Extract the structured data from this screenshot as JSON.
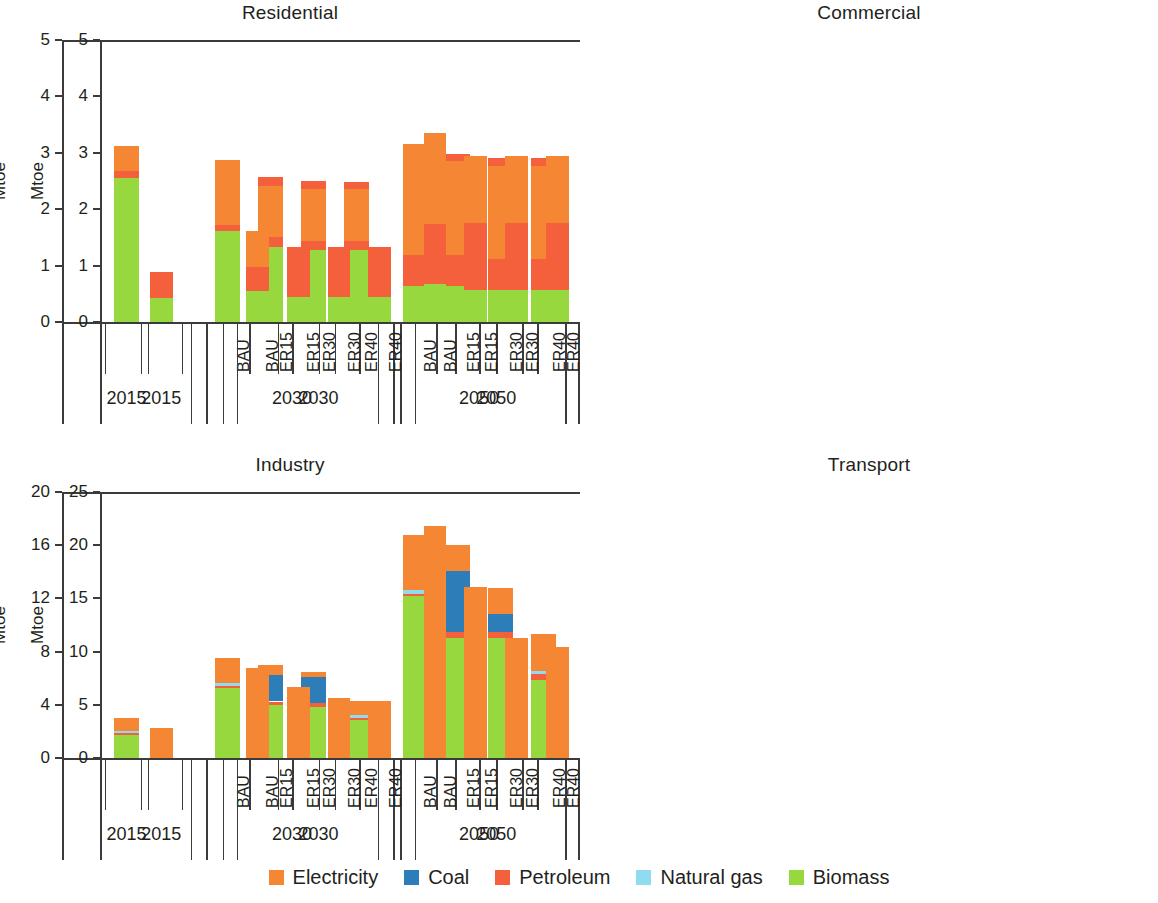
{
  "figure": {
    "ylabel": "Mtoe",
    "year_groups": [
      "2015",
      "2030",
      "2050"
    ],
    "scenarios_2015": [
      "",
      "",
      ""
    ],
    "scenarios": [
      "BAU",
      "ER15",
      "ER30",
      "ER40"
    ]
  },
  "legend": {
    "position": "bottom-center",
    "items": [
      {
        "label": "Electricity",
        "color": "#f58634"
      },
      {
        "label": "Coal",
        "color": "#2d7eb8"
      },
      {
        "label": "Petroleum",
        "color": "#f4603c"
      },
      {
        "label": "Natural gas",
        "color": "#8fdcf0"
      },
      {
        "label": "Biomass",
        "color": "#97d83f"
      }
    ]
  },
  "chart_data": [
    {
      "type": "bar",
      "stacked": true,
      "title": "Residential",
      "xlabel": "",
      "ylabel": "Mtoe",
      "ylim": [
        0,
        5
      ],
      "yticks": [
        0,
        1,
        2,
        3,
        4,
        5
      ],
      "grid": false,
      "groups": [
        "2015",
        "2030",
        "2050"
      ],
      "categories": [
        "2015",
        "2030 BAU",
        "2030 ER15",
        "2030 ER30",
        "2030 ER40",
        "2050 BAU",
        "2050 ER15",
        "2050 ER30",
        "2050 ER40"
      ],
      "series": [
        {
          "name": "Biomass",
          "color": "#97d83f",
          "values": [
            2.56,
            1.62,
            1.33,
            1.27,
            1.27,
            0.63,
            0.63,
            0.57,
            0.57
          ]
        },
        {
          "name": "Petroleum",
          "color": "#f4603c",
          "values": [
            0.12,
            0.1,
            0.17,
            0.16,
            0.16,
            0.55,
            0.55,
            0.55,
            0.55
          ]
        },
        {
          "name": "Natural gas",
          "color": "#8fdcf0",
          "values": [
            0.0,
            0.0,
            0.0,
            0.0,
            0.0,
            0.0,
            0.0,
            0.0,
            0.0
          ]
        },
        {
          "name": "Coal",
          "color": "#2d7eb8",
          "values": [
            0.0,
            0.0,
            0.0,
            0.0,
            0.0,
            0.0,
            0.0,
            0.0,
            0.0
          ]
        },
        {
          "name": "Electricity",
          "color": "#f58634",
          "values": [
            0.44,
            1.15,
            0.92,
            0.92,
            0.92,
            1.97,
            1.67,
            1.64,
            1.64
          ]
        },
        {
          "name": "Petroleum (top)",
          "color": "#f4603c",
          "values": [
            0.0,
            0.0,
            0.15,
            0.15,
            0.14,
            0.0,
            0.13,
            0.14,
            0.14
          ]
        }
      ],
      "totals": [
        3.12,
        2.87,
        2.57,
        2.5,
        2.49,
        3.15,
        2.98,
        2.9,
        2.9
      ]
    },
    {
      "type": "bar",
      "stacked": true,
      "title": "Commercial",
      "xlabel": "",
      "ylabel": "Mtoe",
      "ylim": [
        0,
        5
      ],
      "yticks": [
        0,
        1,
        2,
        3,
        4,
        5
      ],
      "grid": false,
      "groups": [
        "2015",
        "2030",
        "2050"
      ],
      "categories": [
        "2015",
        "2030 BAU",
        "2030 ER15",
        "2030 ER30",
        "2030 ER40",
        "2050 BAU",
        "2050 ER15",
        "2050 ER30",
        "2050 ER40"
      ],
      "series": [
        {
          "name": "Biomass",
          "color": "#97d83f",
          "values": [
            0.42,
            0.55,
            0.45,
            0.45,
            0.45,
            0.68,
            0.57,
            0.57,
            0.57
          ]
        },
        {
          "name": "Petroleum",
          "color": "#f4603c",
          "values": [
            0.47,
            0.42,
            0.88,
            0.88,
            0.88,
            1.06,
            1.18,
            1.18,
            1.18
          ]
        },
        {
          "name": "Natural gas",
          "color": "#8fdcf0",
          "values": [
            0.0,
            0.0,
            0.0,
            0.0,
            0.0,
            0.0,
            0.0,
            0.0,
            0.0
          ]
        },
        {
          "name": "Coal",
          "color": "#2d7eb8",
          "values": [
            0.0,
            0.0,
            0.0,
            0.0,
            0.0,
            0.0,
            0.0,
            0.0,
            0.0
          ]
        },
        {
          "name": "Electricity",
          "color": "#f58634",
          "values": [
            0.0,
            0.65,
            0.0,
            0.0,
            0.0,
            1.62,
            1.2,
            1.2,
            1.2
          ]
        }
      ],
      "totals": [
        0.89,
        1.62,
        1.33,
        1.33,
        1.33,
        3.36,
        2.95,
        2.95,
        2.95
      ]
    },
    {
      "type": "bar",
      "stacked": true,
      "title": "Industry",
      "xlabel": "",
      "ylabel": "Mtoe",
      "ylim": [
        0,
        20
      ],
      "yticks": [
        0,
        4,
        8,
        12,
        16,
        20
      ],
      "grid": false,
      "groups": [
        "2015",
        "2030",
        "2050"
      ],
      "categories": [
        "2015",
        "2030 BAU",
        "2030 ER15",
        "2030 ER30",
        "2030 ER40",
        "2050 BAU",
        "2050 ER15",
        "2050 ER30",
        "2050 ER40"
      ],
      "series": [
        {
          "name": "Biomass",
          "color": "#97d83f",
          "values": [
            1.75,
            5.3,
            4.0,
            3.85,
            2.85,
            12.2,
            9.0,
            9.0,
            5.85
          ]
        },
        {
          "name": "Petroleum",
          "color": "#f4603c",
          "values": [
            0.1,
            0.15,
            0.25,
            0.25,
            0.15,
            0.15,
            0.45,
            0.45,
            0.45
          ]
        },
        {
          "name": "Natural gas",
          "color": "#8fdcf0",
          "values": [
            0.15,
            0.2,
            0.0,
            0.0,
            0.2,
            0.25,
            0.0,
            0.0,
            0.25
          ]
        },
        {
          "name": "Coal",
          "color": "#2d7eb8",
          "values": [
            0.0,
            0.0,
            2.0,
            2.0,
            0.0,
            0.0,
            4.6,
            1.35,
            0.0
          ]
        },
        {
          "name": "Electricity",
          "color": "#f58634",
          "values": [
            1.0,
            1.85,
            0.75,
            0.35,
            1.1,
            4.2,
            1.95,
            1.95,
            2.75
          ]
        }
      ],
      "totals": [
        3.0,
        7.5,
        7.0,
        6.45,
        4.3,
        16.8,
        16.0,
        12.75,
        9.3
      ]
    },
    {
      "type": "bar",
      "stacked": true,
      "title": "Transport",
      "xlabel": "",
      "ylabel": "Mtoe",
      "ylim": [
        0,
        25
      ],
      "yticks": [
        0,
        5,
        10,
        15,
        20,
        25
      ],
      "grid": false,
      "groups": [
        "2015",
        "2030",
        "2050"
      ],
      "categories": [
        "2015",
        "2030 BAU",
        "2030 ER15",
        "2030 ER30",
        "2030 ER40",
        "2050 BAU",
        "2050 ER15",
        "2050 ER30",
        "2050 ER40"
      ],
      "series": [
        {
          "name": "Biomass",
          "color": "#97d83f",
          "values": [
            0.0,
            0.0,
            0.0,
            0.0,
            0.0,
            0.0,
            0.0,
            0.0,
            0.0
          ]
        },
        {
          "name": "Petroleum",
          "color": "#f4603c",
          "values": [
            0.0,
            0.0,
            0.0,
            0.0,
            0.0,
            0.0,
            0.0,
            0.0,
            0.0
          ]
        },
        {
          "name": "Natural gas",
          "color": "#8fdcf0",
          "values": [
            0.0,
            0.0,
            0.0,
            0.0,
            0.0,
            0.0,
            0.0,
            0.0,
            0.0
          ]
        },
        {
          "name": "Coal",
          "color": "#2d7eb8",
          "values": [
            0.0,
            0.0,
            0.0,
            0.0,
            0.0,
            0.0,
            0.0,
            0.0,
            0.0
          ]
        },
        {
          "name": "Electricity",
          "color": "#f58634",
          "values": [
            2.8,
            8.5,
            6.7,
            5.65,
            5.4,
            21.8,
            16.1,
            11.3,
            10.4
          ]
        }
      ],
      "totals": [
        2.8,
        8.5,
        6.7,
        5.65,
        5.4,
        21.8,
        16.1,
        11.3,
        10.4
      ]
    }
  ]
}
